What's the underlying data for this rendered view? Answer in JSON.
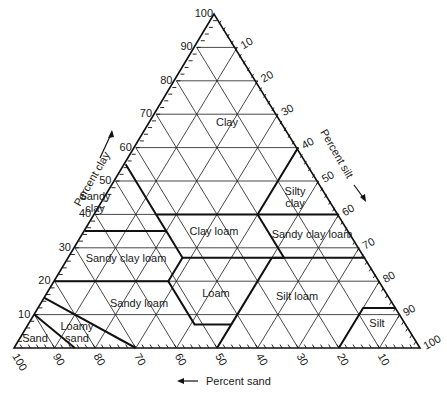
{
  "diagram": {
    "type": "soil-texture-triangle",
    "geometry": {
      "apex": [
        214,
        14
      ],
      "bottom_left": [
        14,
        348
      ],
      "bottom_right": [
        420,
        348
      ]
    },
    "colors": {
      "line": "#111111",
      "text": "#1a1a1a",
      "background": "#ffffff"
    },
    "axes": {
      "clay": {
        "title": "Percent clay",
        "direction_arrow": "up",
        "ticks": [
          "10",
          "20",
          "30",
          "40",
          "50",
          "60",
          "70",
          "80",
          "90",
          "100"
        ]
      },
      "silt": {
        "title": "Percent silt",
        "direction_arrow": "down-right",
        "ticks": [
          "10",
          "20",
          "30",
          "40",
          "50",
          "60",
          "70",
          "80",
          "90",
          "100"
        ]
      },
      "sand": {
        "title": "Percent sand",
        "direction_arrow": "left",
        "ticks": [
          "100",
          "90",
          "80",
          "70",
          "60",
          "50",
          "40",
          "30",
          "20",
          "10"
        ]
      }
    },
    "regions": [
      {
        "name": "Clay",
        "label": "Clay",
        "label_pos": [
          227,
          126
        ]
      },
      {
        "name": "Sandy clay",
        "label": "Sandy\nclay",
        "label_pos": [
          95,
          200
        ]
      },
      {
        "name": "Silty clay",
        "label": "Silty\nclay",
        "label_pos": [
          295,
          195
        ]
      },
      {
        "name": "Clay loam",
        "label": "Clay loam",
        "label_pos": [
          214,
          235
        ]
      },
      {
        "name": "Sandy clay loam (right)",
        "label": "Sandy clay loam",
        "label_pos": [
          312,
          238
        ]
      },
      {
        "name": "Sandy clay loam",
        "label": "Sandy clay loam",
        "label_pos": [
          126,
          262
        ]
      },
      {
        "name": "Loam",
        "label": "Loam",
        "label_pos": [
          216,
          297
        ]
      },
      {
        "name": "Sandy loam",
        "label": "Sandy loam",
        "label_pos": [
          139,
          307
        ]
      },
      {
        "name": "Silt loam",
        "label": "Silt loam",
        "label_pos": [
          297,
          300
        ]
      },
      {
        "name": "Loamy sand",
        "label": "Loamy\nsand",
        "label_pos": [
          77,
          330
        ]
      },
      {
        "name": "Sand",
        "label": "Sand",
        "label_pos": [
          35,
          342
        ]
      },
      {
        "name": "Silt",
        "label": "Silt",
        "label_pos": [
          377,
          327
        ]
      }
    ],
    "boundaries": [
      [
        [
          45,
          0,
          55
        ],
        [
          45,
          15,
          40
        ],
        [
          20,
          40,
          40
        ],
        [
          0,
          40,
          60
        ]
      ],
      [
        [
          45,
          15,
          40
        ],
        [
          45,
          20,
          35
        ],
        [
          65,
          0,
          35
        ]
      ],
      [
        [
          20,
          40,
          40
        ],
        [
          0,
          60,
          40
        ]
      ],
      [
        [
          45,
          20,
          35
        ],
        [
          45,
          28,
          27
        ],
        [
          52,
          28,
          20
        ],
        [
          80,
          0,
          20
        ]
      ],
      [
        [
          45,
          28,
          27
        ],
        [
          20,
          53,
          27
        ],
        [
          0,
          73,
          27
        ]
      ],
      [
        [
          20,
          40,
          40
        ],
        [
          20,
          53,
          27
        ]
      ],
      [
        [
          20,
          53,
          27
        ],
        [
          23,
          50,
          27
        ]
      ],
      [
        [
          52,
          28,
          20
        ],
        [
          52,
          41,
          7
        ],
        [
          43,
          50,
          7
        ],
        [
          50,
          50,
          0
        ]
      ],
      [
        [
          43,
          50,
          7
        ],
        [
          23,
          50,
          27
        ]
      ],
      [
        [
          0,
          88,
          12
        ],
        [
          8,
          80,
          12
        ],
        [
          20,
          80,
          0
        ]
      ],
      [
        [
          85,
          0,
          15
        ],
        [
          70,
          30,
          0
        ]
      ],
      [
        [
          90,
          0,
          10
        ],
        [
          85,
          15,
          0
        ]
      ]
    ]
  }
}
